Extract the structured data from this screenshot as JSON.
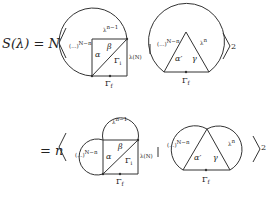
{
  "equation": {
    "lhs": "S(λ) = N",
    "rhs_prefix": "= n",
    "exponent": "2",
    "separator": "|"
  },
  "top_row": {
    "left_diagram": {
      "loop_label_left": "(...)",
      "loop_exp_left": "N−n",
      "loop_label_top": "λ",
      "loop_exp_top": "n−1",
      "label_alpha": "α",
      "label_beta": "β",
      "label_gamma1": "Γ",
      "label_gamma1_sub": "i",
      "label_side": "λ(N)",
      "label_bottom": "Γ",
      "label_bottom_sub": "f"
    },
    "right_diagram": {
      "loop_label_left": "(...)",
      "loop_exp_left": "N−n",
      "loop_label_right": "λ",
      "loop_exp_right": "n",
      "label_alpha_prime": "α′",
      "label_gamma": "γ",
      "label_bottom": "Γ",
      "label_bottom_sub": "f"
    }
  },
  "bottom_row": {
    "left_diagram": {
      "loop_label_left": "(...)",
      "loop_exp_left": "N−n",
      "loop_label_top": "λ",
      "loop_exp_top": "n−1",
      "label_alpha": "α",
      "label_beta": "β",
      "label_gamma1": "Γ",
      "label_gamma1_sub": "i",
      "label_side": "λ(N)",
      "label_bottom": "Γ",
      "label_bottom_sub": "f"
    },
    "right_diagram": {
      "loop_label_left": "(...)",
      "loop_exp_left": "N−n",
      "loop_label_right": "λ",
      "loop_exp_right": "n",
      "label_alpha_prime": "α′",
      "label_gamma": "γ",
      "label_bottom": "Γ",
      "label_bottom_sub": "f"
    }
  }
}
